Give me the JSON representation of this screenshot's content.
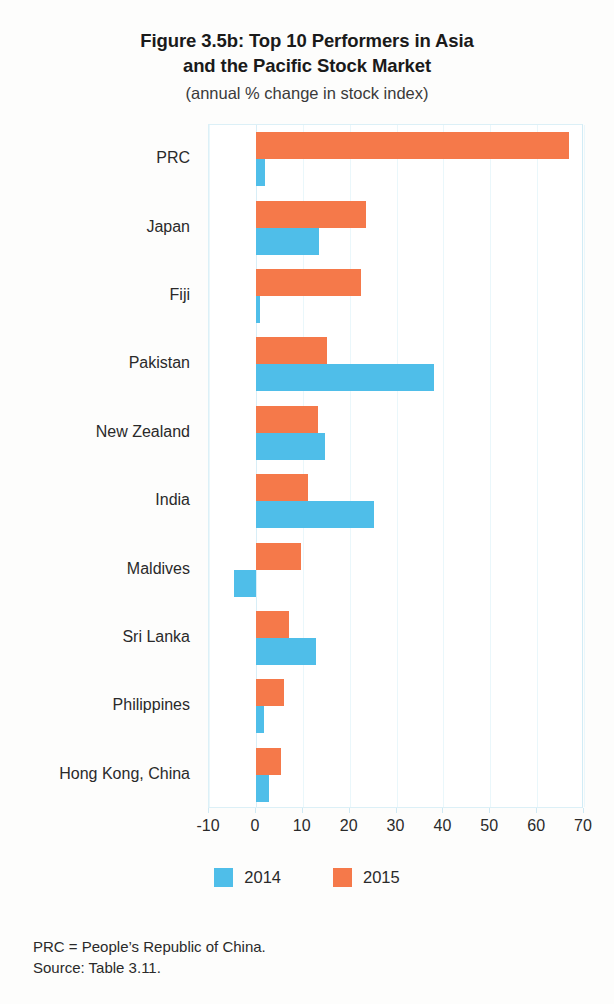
{
  "figure": {
    "title": "Figure 3.5b:  Top 10 Performers in Asia\nand the Pacific Stock Market",
    "subtitle": "(annual % change in stock index)"
  },
  "legend": {
    "items": [
      {
        "label": "2014",
        "color": "#4fbee9"
      },
      {
        "label": "2015",
        "color": "#f5794a"
      }
    ]
  },
  "footnotes": {
    "abbreviation": "PRC = People’s Republic of China.",
    "source": "Source:  Table 3.11."
  },
  "axis": {
    "ticks": [
      "-10",
      "0",
      "10",
      "20",
      "30",
      "40",
      "50",
      "60",
      "70"
    ]
  },
  "chart_data": {
    "type": "bar",
    "orientation": "horizontal",
    "title": "Figure 3.5b:  Top 10 Performers in Asia and the Pacific Stock Market",
    "subtitle": "(annual % change in stock index)",
    "xlabel": "",
    "ylabel": "",
    "xlim": [
      -10,
      70
    ],
    "xticks": [
      -10,
      0,
      10,
      20,
      30,
      40,
      50,
      60,
      70
    ],
    "grid": true,
    "legend_position": "bottom",
    "categories": [
      "PRC",
      "Japan",
      "Fiji",
      "Pakistan",
      "New Zealand",
      "India",
      "Maldives",
      "Sri Lanka",
      "Philippines",
      "Hong Kong, China"
    ],
    "series": [
      {
        "name": "2014",
        "color": "#4fbee9",
        "values": [
          2.0,
          13.5,
          0.8,
          38.0,
          14.8,
          25.3,
          -4.7,
          12.9,
          1.8,
          2.8
        ]
      },
      {
        "name": "2015",
        "color": "#f5794a",
        "values": [
          66.7,
          23.4,
          22.5,
          15.2,
          13.3,
          11.2,
          9.6,
          7.0,
          6.0,
          5.3
        ]
      }
    ]
  }
}
